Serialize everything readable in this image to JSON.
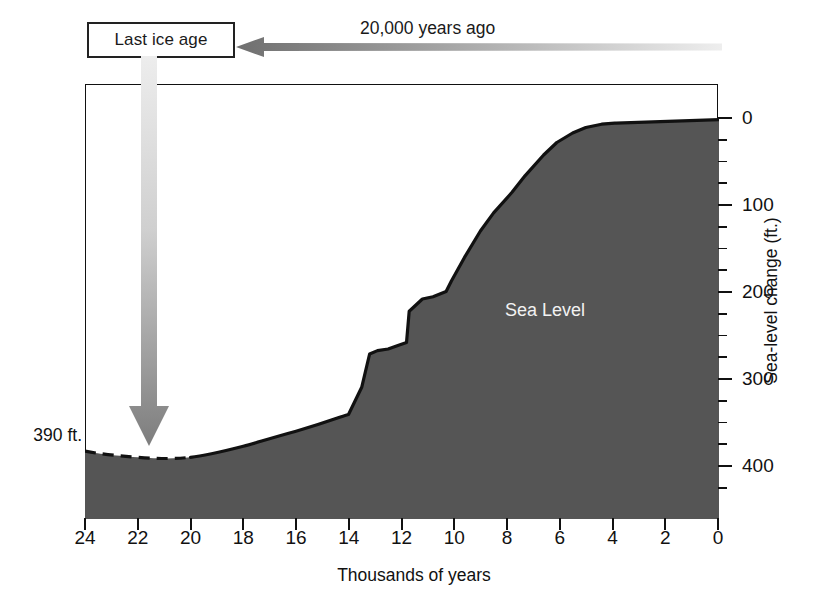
{
  "annotations": {
    "ice_age_box_label": "Last ice age",
    "years_ago_label": "20,000 years ago",
    "sea_level_label": "Sea Level",
    "depth_callout": "390 ft."
  },
  "icons": {
    "left-arrow-icon": "left-arrow-icon",
    "down-arrow-icon": "down-arrow-icon"
  },
  "colors": {
    "sea_fill": "#555555",
    "curve_stroke": "#111111",
    "axis": "#111111",
    "label_on_fill": "#f2f2f2",
    "arrow_dark": "#6f6f6f",
    "arrow_light": "#e9e9e9"
  },
  "chart_data": {
    "type": "area",
    "title": "",
    "subtitle": "",
    "xlabel": "Thousands of years",
    "ylabel": "Sea-level change (ft.)",
    "xlim": [
      24,
      0
    ],
    "ylim": [
      430,
      -10
    ],
    "x_reversed": true,
    "y_inverted": true,
    "grid": false,
    "legend": null,
    "x_ticks": [
      24,
      22,
      20,
      18,
      16,
      14,
      12,
      10,
      8,
      6,
      4,
      2,
      0
    ],
    "x_tick_labels": [
      "24",
      "22",
      "20",
      "18",
      "16",
      "14",
      "12",
      "10",
      "8",
      "6",
      "4",
      "2",
      "0"
    ],
    "x_minor_tick_step": 2,
    "y_ticks": [
      0,
      100,
      200,
      300,
      400
    ],
    "y_tick_labels": [
      "0",
      "100",
      "200",
      "300",
      "400"
    ],
    "y_minor_tick_step": 25,
    "y_axis_position": "right",
    "series": [
      {
        "name": "Sea Level",
        "units": "feet below present sea level",
        "x": [
          24.0,
          23.0,
          22.0,
          21.0,
          20.0,
          19.0,
          18.0,
          17.0,
          16.0,
          15.5,
          15.0,
          14.6,
          14.3,
          14.0,
          13.6,
          13.0,
          12.6,
          12.2,
          12.0,
          11.6,
          11.0,
          10.4,
          10.0,
          9.4,
          9.0,
          8.4,
          8.0,
          7.4,
          7.0,
          6.6,
          6.0,
          5.0,
          4.0,
          3.0,
          2.0,
          1.0,
          0.0
        ],
        "y": [
          383,
          388,
          390,
          390,
          388,
          382,
          372,
          360,
          345,
          338,
          334,
          310,
          268,
          258,
          255,
          248,
          222,
          208,
          205,
          188,
          160,
          130,
          116,
          90,
          76,
          50,
          38,
          18,
          9,
          7,
          6,
          5,
          4,
          3,
          2,
          1,
          0
        ],
        "dashed_segment_x": [
          24.0,
          19.8
        ],
        "dashed_note": "lowstand portion drawn as dashed line"
      }
    ],
    "annotations": [
      {
        "text": "390 ft.",
        "x": 24.4,
        "y": 390,
        "note": "maximum lowstand callout at left"
      },
      {
        "text": "Sea Level",
        "x": 7.6,
        "y": 222,
        "note": "label inside shaded area"
      },
      {
        "text": "Last ice age",
        "x": 21.5,
        "y": null,
        "note": "boxed label above plot with downward arrow"
      },
      {
        "text": "20,000 years ago",
        "x": 12.5,
        "y": null,
        "note": "above leftward arrow"
      }
    ]
  },
  "axes": {
    "y_title": "Sea-level change (ft.)",
    "x_title": "Thousands of years"
  }
}
